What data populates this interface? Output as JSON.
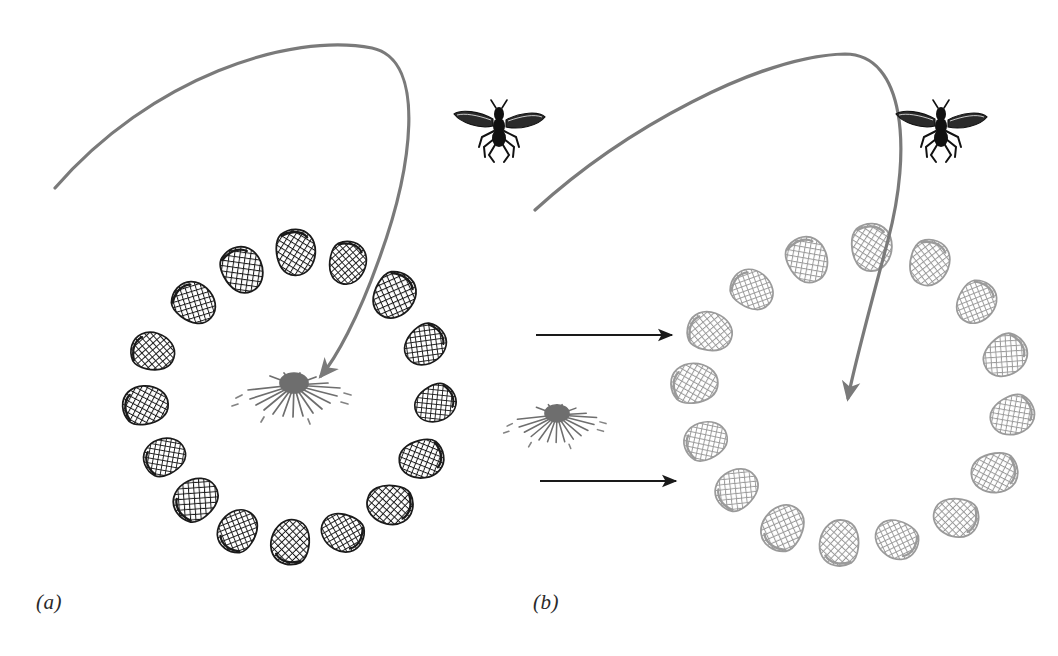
{
  "figure": {
    "domain": "scientific-illustration",
    "background_color": "#ffffff",
    "width": 1058,
    "height": 656,
    "caption_note": "Two-panel behavioural experiment diagram: a wasp's landmark-based homing. Panel (a) shows the insect returning to a nest marked by a ring of pine cones. Panel (b) shows the ring of cones displaced, and the insect searching at the displaced ring centre rather than at the true nest."
  },
  "panels": [
    {
      "id": "a",
      "label": "(a)",
      "label_x": 36,
      "label_y": 590,
      "cone_color": "#1a1a1a",
      "cone_count": 16,
      "ring": {
        "center_x": 277,
        "center_y": 400,
        "radius_x": 145,
        "radius_y": 150
      },
      "nest": {
        "name": "nest-flower",
        "center_x": 294,
        "center_y": 385,
        "color": "#6e6e6e",
        "inside_ring": true
      },
      "flight_path": {
        "name": "flight-path-curve",
        "color": "#7a7a7a",
        "stroke_width": 3.2,
        "start_x": 55,
        "start_y": 188,
        "apex_x": 372,
        "apex_y": 44,
        "end_x": 318,
        "end_y": 378,
        "arrowhead": true,
        "arrow_target": "nest-flower"
      },
      "insect": {
        "name": "wasp",
        "center_x": 499,
        "center_y": 133,
        "color": "#111111"
      }
    },
    {
      "id": "b",
      "label": "(b)",
      "label_x": 533,
      "label_y": 590,
      "cone_color": "#9a9a9a",
      "cone_count": 16,
      "ring": {
        "center_x": 848,
        "center_y": 400,
        "radius_x": 172,
        "radius_y": 170
      },
      "nest": {
        "name": "nest-flower-displaced",
        "center_x": 557,
        "center_y": 415,
        "color": "#6e6e6e",
        "inside_ring": false
      },
      "flight_path": {
        "name": "flight-path-curve",
        "color": "#7a7a7a",
        "stroke_width": 3.2,
        "start_x": 535,
        "start_y": 210,
        "apex_x": 843,
        "apex_y": 50,
        "end_x": 845,
        "end_y": 404,
        "arrowhead": true,
        "arrow_target": "ring-center"
      },
      "insect": {
        "name": "wasp",
        "center_x": 941,
        "center_y": 133,
        "color": "#111111"
      }
    }
  ],
  "transition_arrows": [
    {
      "name": "transition-arrow-top",
      "x1": 536,
      "y1": 335,
      "x2": 676,
      "y2": 335,
      "color": "#1a1a1a",
      "stroke_width": 2.1
    },
    {
      "name": "transition-arrow-bottom",
      "x1": 540,
      "y1": 481,
      "x2": 680,
      "y2": 481,
      "color": "#1a1a1a",
      "stroke_width": 2.1
    }
  ],
  "cone_layout": {
    "note": "Angles in degrees measured clockwise from 12 o'clock; each cone is drawn as a crosshatched pine-cone glyph with slight individual rotation.",
    "panel_a_angles": [
      8,
      30,
      52,
      74,
      96,
      118,
      140,
      162,
      186,
      208,
      230,
      252,
      274,
      296,
      318,
      340
    ],
    "panel_b_angles": [
      10,
      32,
      54,
      76,
      98,
      120,
      142,
      164,
      188,
      210,
      232,
      254,
      276,
      298,
      320,
      342
    ],
    "panel_a_cone_size": 44,
    "panel_b_cone_size": 46
  },
  "palette": {
    "ink_black": "#1a1a1a",
    "cone_gray": "#9a9a9a",
    "path_gray": "#7a7a7a",
    "nest_gray": "#6e6e6e",
    "background": "#ffffff"
  }
}
